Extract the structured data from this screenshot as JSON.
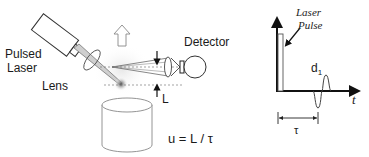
{
  "left_panel": {
    "labels": {
      "pulsed_laser_line1": "Pulsed",
      "pulsed_laser_line2": "Laser",
      "lens": "Lens",
      "detector": "Detector",
      "distance": "L",
      "equation": "u = L / τ"
    },
    "components": [
      "pulsed-laser",
      "lens",
      "laser-beam",
      "focal-spot",
      "up-arrow",
      "detector-optics",
      "detector",
      "sample-cylinder",
      "distance-markers"
    ]
  },
  "right_panel": {
    "labels": {
      "pulse_line1": "Laser",
      "pulse_line2": "Pulse",
      "echo": "d",
      "echo_subscript": "1",
      "time_axis": "t",
      "delay": "τ"
    }
  },
  "colors": {
    "ink": "#1a1a1a",
    "outline": "#333333",
    "beam": "#777777",
    "glow": "#dcdcdc",
    "background": "#ffffff"
  }
}
